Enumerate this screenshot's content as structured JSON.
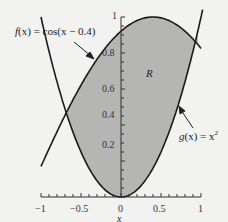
{
  "chart_data": {
    "type": "line",
    "title": "",
    "xlabel": "x",
    "ylabel": "",
    "xlim": [
      -1,
      1
    ],
    "ylim": [
      0,
      1
    ],
    "grid": false,
    "legend": null,
    "x_ticks": [
      "-1",
      "-0.5",
      "0",
      "0.5",
      "1"
    ],
    "y_ticks": [
      "0.2",
      "0.4",
      "0.6",
      "0.8",
      "1"
    ],
    "series": [
      {
        "name": "f(x) = cos(x − 0.4)",
        "expression": "cos(x - 0.4)",
        "x": [
          -1,
          -0.8,
          -0.6,
          -0.4,
          -0.2,
          0,
          0.2,
          0.4,
          0.6,
          0.8,
          1
        ],
        "values": [
          0.17,
          0.36,
          0.54,
          0.7,
          0.83,
          0.92,
          0.98,
          1.0,
          0.98,
          0.92,
          0.83
        ]
      },
      {
        "name": "g(x) = x²",
        "expression": "x^2",
        "x": [
          -1,
          -0.8,
          -0.6,
          -0.4,
          -0.2,
          0,
          0.2,
          0.4,
          0.6,
          0.8,
          1
        ],
        "values": [
          1.0,
          0.64,
          0.36,
          0.16,
          0.04,
          0,
          0.04,
          0.16,
          0.36,
          0.64,
          1.0
        ]
      }
    ],
    "shaded_region": {
      "label": "R",
      "between": [
        "f(x)",
        "g(x)"
      ],
      "x_range": [
        -0.67,
        0.96
      ],
      "color": "#b5b5b3"
    },
    "annotations": [
      {
        "text": "f(x) = cos(x − 0.4)",
        "arrow_to": "f curve near x = -0.35"
      },
      {
        "text": "g(x) = x²",
        "arrow_to": "g curve near x = 0.7"
      },
      {
        "text": "R",
        "position": "inside shaded region"
      }
    ]
  },
  "labels": {
    "f_label_prefix": "f",
    "f_label_rest": "(x) = cos(x − 0.4)",
    "g_label_prefix": "g",
    "g_label_rest": "(x) = x",
    "g_label_sup": "2",
    "region": "R",
    "xlabel": "x",
    "xt_m1": "−1",
    "xt_m05": "−0.5",
    "xt_0": "0",
    "xt_05": "0.5",
    "xt_1": "1",
    "yt_02": "0.2",
    "yt_04": "0.4",
    "yt_06": "0.6",
    "yt_08": "0.8",
    "yt_1": "1"
  },
  "colors": {
    "background": "#f2f2f0",
    "fill": "#b5b5b3",
    "curve": "#1a1a1a"
  }
}
